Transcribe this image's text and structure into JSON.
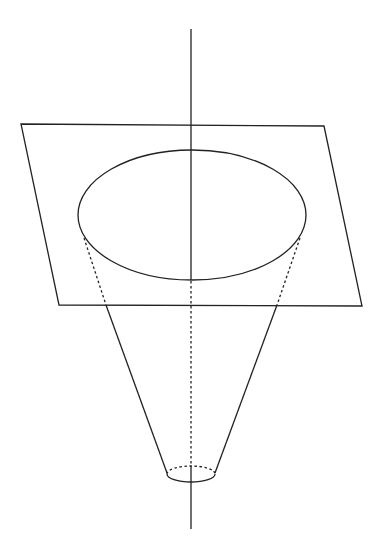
{
  "diagram": {
    "title": "",
    "colors": {
      "stroke": "#222222",
      "background": "#ffffff"
    },
    "plane": {
      "corners": [
        [
          21,
          124
        ],
        [
          324,
          126
        ],
        [
          362,
          306
        ],
        [
          59,
          305
        ]
      ]
    },
    "axis": {
      "x": 191,
      "y_top": 29,
      "y_bottom": 529
    },
    "large_ellipse": {
      "cx": 192,
      "cy": 215,
      "rx": 114,
      "ry": 65
    },
    "small_ellipse": {
      "cx": 191,
      "cy": 474,
      "rx": 24,
      "ry": 8
    },
    "labels": []
  }
}
